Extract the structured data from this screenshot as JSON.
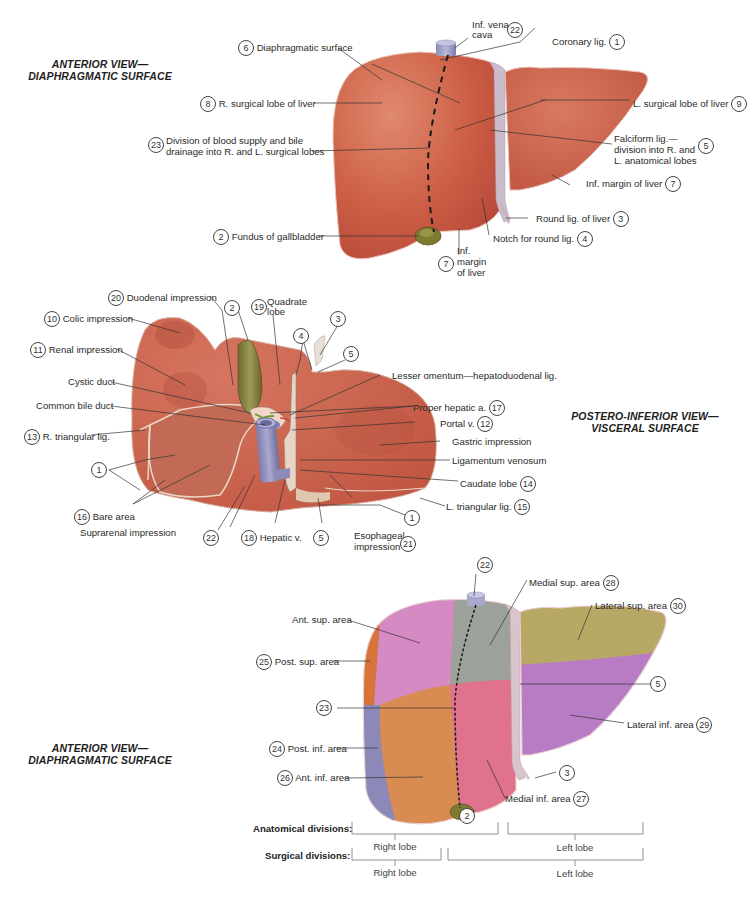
{
  "colors": {
    "liver": "#c9573f",
    "liver_light": "#d9735a",
    "ligament": "#c8b8c8",
    "ivc": "#9c9cc4",
    "gallbladder": "#8a8440",
    "ant_sup_area": "#d48ac4",
    "post_sup_area": "#d6743a",
    "medial_sup_area": "#9aa09a",
    "lateral_sup_area": "#b8a866",
    "ant_inf_area": "#d8944e",
    "post_inf_area": "#8c88b8",
    "medial_inf_area": "#e0708e",
    "lateral_inf_area": "#b77cc4"
  },
  "panel1": {
    "title_line1": "ANTERIOR VIEW—",
    "title_line2": "DIAPHRAGMATIC SURFACE",
    "labels": {
      "diaphragmatic_surface": {
        "num": "6",
        "text": "Diaphragmatic surface"
      },
      "inf_vena_cava": {
        "num": "22",
        "line1": "Inf. vena",
        "line2": "cava"
      },
      "coronary_lig": {
        "num": "1",
        "text": "Coronary lig."
      },
      "r_surgical_lobe": {
        "num": "8",
        "text": "R. surgical lobe of liver"
      },
      "l_surgical_lobe": {
        "num": "9",
        "text": "L. surgical lobe of liver"
      },
      "division_blood_supply": {
        "num": "23",
        "line1": "Division of blood supply and bile",
        "line2": "drainage into R. and L. surgical lobes"
      },
      "falciform_lig": {
        "num": "5",
        "line1": "Falciform lig.—",
        "line2": "division into R. and",
        "line3": "L. anatomical lobes"
      },
      "inf_margin_right": {
        "num": "7",
        "text": "Inf. margin of liver"
      },
      "round_lig": {
        "num": "3",
        "text": "Round lig. of liver"
      },
      "fundus_gallbladder": {
        "num": "2",
        "text": "Fundus of gallbladder"
      },
      "notch_round_lig": {
        "num": "4",
        "text": "Notch for round lig."
      },
      "inf_margin_bottom": {
        "num": "7",
        "line1": "Inf.",
        "line2": "margin",
        "line3": "of liver"
      }
    }
  },
  "panel2": {
    "title_line1": "POSTERO-INFERIOR VIEW—",
    "title_line2": "VISCERAL SURFACE",
    "labels": {
      "duodenal_impression": {
        "num": "20",
        "text": "Duodenal impression"
      },
      "gallbladder_num": {
        "num": "2"
      },
      "quadrate_lobe": {
        "num": "19",
        "line1": "Quadrate",
        "line2": "lobe"
      },
      "round_lig_num": {
        "num": "3"
      },
      "notch_num": {
        "num": "4"
      },
      "falciform_num": {
        "num": "5"
      },
      "colic_impression": {
        "num": "10",
        "text": "Colic impression"
      },
      "renal_impression": {
        "num": "11",
        "text": "Renal impression"
      },
      "cystic_duct": {
        "text": "Cystic duct"
      },
      "common_bile_duct": {
        "text": "Common bile duct"
      },
      "r_triangular_lig": {
        "num": "13",
        "text": "R. triangular lig."
      },
      "coronary_num_left": {
        "num": "1"
      },
      "bare_area": {
        "num": "16",
        "text": "Bare area"
      },
      "suprarenal_impression": {
        "text": "Suprarenal impression"
      },
      "ivc_num": {
        "num": "22"
      },
      "hepatic_v": {
        "num": "18",
        "text": "Hepatic v."
      },
      "falciform_num_bottom": {
        "num": "5"
      },
      "esophageal_impression": {
        "num": "21",
        "line1": "Esophageal",
        "line2": "impression"
      },
      "lesser_omentum": {
        "text": "Lesser omentum—hepatoduodenal lig."
      },
      "proper_hepatic_a": {
        "num": "17",
        "text": "Proper hepatic a."
      },
      "portal_v": {
        "num": "12",
        "text": "Portal v."
      },
      "gastric_impression": {
        "text": "Gastric impression"
      },
      "ligamentum_venosum": {
        "text": "Ligamentum venosum"
      },
      "caudate_lobe": {
        "num": "14",
        "text": "Caudate lobe"
      },
      "coronary_num_right": {
        "num": "1"
      },
      "l_triangular_lig": {
        "num": "15",
        "text": "L. triangular lig."
      }
    }
  },
  "panel3": {
    "title_line1": "ANTERIOR VIEW—",
    "title_line2": "DIAPHRAGMATIC SURFACE",
    "labels": {
      "ivc_num": {
        "num": "22"
      },
      "medial_sup_area": {
        "num": "28",
        "text": "Medial sup. area"
      },
      "lateral_sup_area": {
        "num": "30",
        "text": "Lateral sup. area"
      },
      "ant_sup_area": {
        "text": "Ant. sup. area"
      },
      "post_sup_area": {
        "num": "25",
        "text": "Post. sup. area"
      },
      "falciform_num": {
        "num": "5"
      },
      "division_num": {
        "num": "23"
      },
      "lateral_inf_area": {
        "num": "29",
        "text": "Lateral inf. area"
      },
      "post_inf_area": {
        "num": "24",
        "text": "Post. inf. area"
      },
      "ant_inf_area": {
        "num": "26",
        "text": "Ant. inf. area"
      },
      "round_lig_num": {
        "num": "3"
      },
      "medial_inf_area": {
        "num": "27",
        "text": "Medial inf. area"
      },
      "gallbladder_num": {
        "num": "2"
      }
    },
    "divisions": {
      "anatomical_label": "Anatomical divisions:",
      "surgical_label": "Surgical divisions:",
      "anatomical_right": "Right lobe",
      "anatomical_left": "Left lobe",
      "surgical_right": "Right lobe",
      "surgical_left": "Left lobe"
    }
  }
}
